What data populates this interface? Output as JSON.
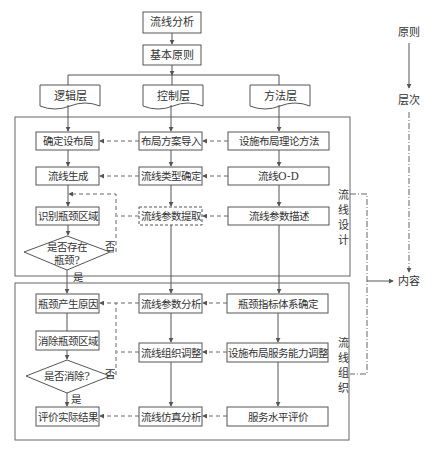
{
  "top": {
    "root": "流线分析",
    "principle": "基本原则"
  },
  "layers": [
    {
      "label": "逻辑层"
    },
    {
      "label": "控制层"
    },
    {
      "label": "方法层"
    }
  ],
  "design_section": {
    "title_chars": [
      "流",
      "线",
      "设",
      "计"
    ],
    "logic_column": [
      "确定设布局",
      "流线生成",
      "识别瓶颈区域"
    ],
    "control_column": [
      "布局方案导入",
      "流线类型确定",
      "流线参数提取"
    ],
    "method_column": [
      "设施布局理论方法",
      "流线O-D",
      "流线参数描述"
    ],
    "decision": {
      "line1": "是否存在",
      "line2": "瓶颈?",
      "yes": "是",
      "no": "否"
    }
  },
  "organization_section": {
    "title_chars": [
      "流",
      "线",
      "组",
      "织"
    ],
    "logic_column": [
      "瓶颈产生原因",
      "消除瓶颈区域",
      "评价实际结果"
    ],
    "control_column": [
      "流线参数分析",
      "流线组织调整",
      "流线仿真分析"
    ],
    "method_column": [
      "瓶颈指标体系确定",
      "设施布局服务能力调整",
      "服务水平评价"
    ],
    "decision": {
      "line1": "是否消除?",
      "yes": "是",
      "no": "否"
    }
  },
  "legend": {
    "principle": "原则",
    "level": "层次",
    "content": "内容"
  },
  "colors": {
    "line": "#555555",
    "text": "#333333",
    "background": "#ffffff"
  }
}
